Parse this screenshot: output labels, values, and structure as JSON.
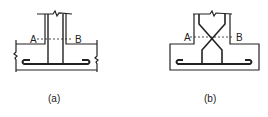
{
  "figures": [
    {
      "id": "a",
      "caption": "(a)",
      "section_labels": {
        "left": "A",
        "right": "B"
      },
      "description": "Column-footing joint with straight vertical bars bent into horizontal bottom bar"
    },
    {
      "id": "b",
      "caption": "(b)",
      "section_labels": {
        "left": "A",
        "right": "B"
      },
      "description": "Column-footing joint with crossed diagonal bars bent into horizontal bottom bar"
    }
  ],
  "colors": {
    "line": "#222222",
    "background": "#ffffff"
  }
}
